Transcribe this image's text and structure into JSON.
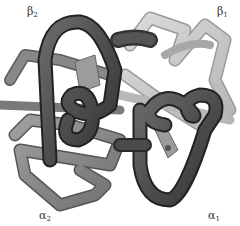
{
  "figure": {
    "subunits": [
      {
        "id": "beta2",
        "symbol": "β",
        "subscript": "2",
        "position": "top-left",
        "shade": "dark"
      },
      {
        "id": "beta1",
        "symbol": "β",
        "subscript": "1",
        "position": "top-right",
        "shade": "light"
      },
      {
        "id": "alpha2",
        "symbol": "α",
        "subscript": "2",
        "position": "bottom-left",
        "shade": "medium"
      },
      {
        "id": "alpha1",
        "symbol": "α",
        "subscript": "1",
        "position": "bottom-right",
        "shade": "dark"
      }
    ],
    "colors": {
      "background": "#ffffff",
      "dark_tube": "#4a4a4a",
      "dark_tube_edge": "#222222",
      "medium_tube": "#8a8a8a",
      "medium_tube_edge": "#555555",
      "light_tube": "#c8c8c8",
      "light_tube_edge": "#9a9a9a",
      "heme": "#9c9c9c",
      "label": "#333333"
    }
  },
  "labels": {
    "beta2": {
      "symbol": "β",
      "sub": "2"
    },
    "beta1": {
      "symbol": "β",
      "sub": "1"
    },
    "alpha2": {
      "symbol": "α",
      "sub": "2"
    },
    "alpha1": {
      "symbol": "α",
      "sub": "1"
    }
  }
}
